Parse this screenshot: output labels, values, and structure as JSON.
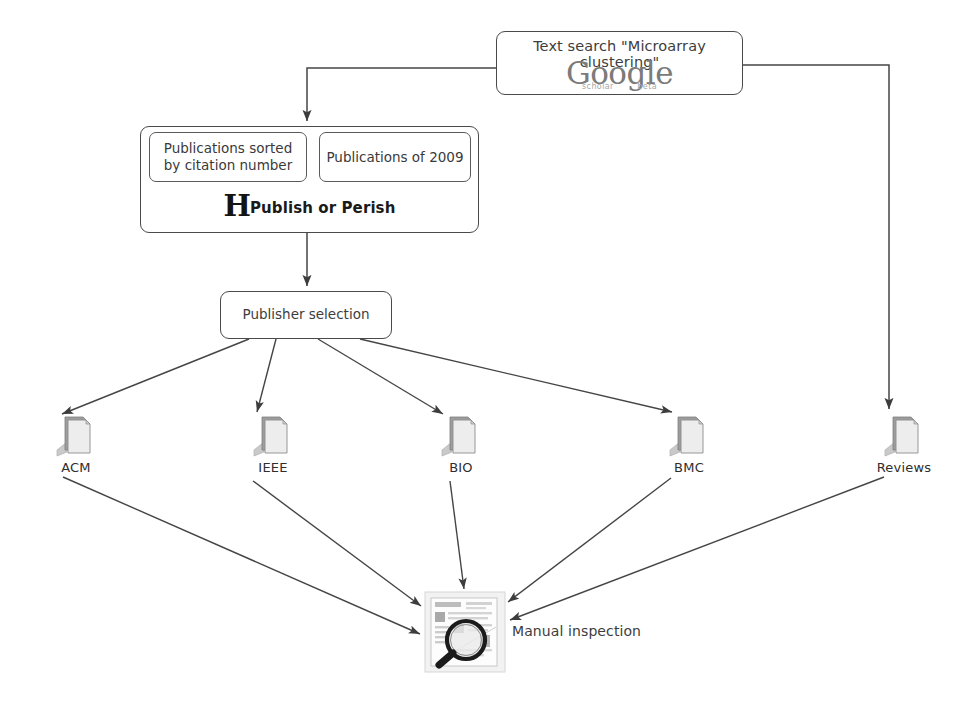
{
  "diagram": {
    "line_color": "#444444",
    "box_border_color": "#4a4a4a",
    "background": "#ffffff"
  },
  "search": {
    "label": "Text search \"Microarray clustering\"",
    "logo_word": "Google",
    "logo_sub_left": "scholar",
    "logo_sub_right": "beta",
    "logo_color": "#7b7b7b"
  },
  "publish_or_perish": {
    "filter_sorted": "Publications sorted by citation number",
    "filter_sorted_line1": "Publications sorted",
    "filter_sorted_line2": "by citation number",
    "filter_year": "Publications of 2009",
    "brand_initial": "H",
    "brand_name": "Publish or Perish"
  },
  "publisher_selection": {
    "label": "Publisher selection"
  },
  "sources": [
    {
      "label": "ACM",
      "icon": "document-stack-icon",
      "x": 30,
      "y": 412
    },
    {
      "label": "IEEE",
      "icon": "document-stack-icon",
      "x": 227,
      "y": 412
    },
    {
      "label": "BIO",
      "icon": "document-stack-icon",
      "x": 415,
      "y": 412
    },
    {
      "label": "BMC",
      "icon": "document-stack-icon",
      "x": 643,
      "y": 412
    },
    {
      "label": "Reviews",
      "icon": "document-stack-icon",
      "x": 858,
      "y": 412
    }
  ],
  "manual_inspection": {
    "label": "Manual inspection",
    "icon": "magnifier-over-document-icon"
  },
  "edges": [
    {
      "from": "search",
      "to": "publish_or_perish",
      "style": "orthogonal"
    },
    {
      "from": "search",
      "to": "Reviews",
      "style": "orthogonal"
    },
    {
      "from": "publish_or_perish",
      "to": "publisher_selection",
      "style": "straight"
    },
    {
      "from": "publisher_selection",
      "to": "ACM",
      "style": "straight"
    },
    {
      "from": "publisher_selection",
      "to": "IEEE",
      "style": "straight"
    },
    {
      "from": "publisher_selection",
      "to": "BIO",
      "style": "straight"
    },
    {
      "from": "publisher_selection",
      "to": "BMC",
      "style": "straight"
    },
    {
      "from": "ACM",
      "to": "manual_inspection",
      "style": "straight"
    },
    {
      "from": "IEEE",
      "to": "manual_inspection",
      "style": "straight"
    },
    {
      "from": "BIO",
      "to": "manual_inspection",
      "style": "straight"
    },
    {
      "from": "BMC",
      "to": "manual_inspection",
      "style": "straight"
    },
    {
      "from": "Reviews",
      "to": "manual_inspection",
      "style": "straight"
    }
  ]
}
